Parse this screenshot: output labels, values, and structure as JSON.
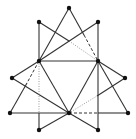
{
  "figure": {
    "width": 136,
    "height": 139,
    "background": "#ffffff",
    "stroke_color": "#333333",
    "light_stroke_color": "#9a9a9a",
    "point_color": "#111111",
    "point_radius": 2.2
  },
  "points": [
    {
      "id": "T",
      "x": 69,
      "y": 8
    },
    {
      "id": "UL",
      "x": 39,
      "y": 22
    },
    {
      "id": "UR",
      "x": 98,
      "y": 22
    },
    {
      "id": "ML",
      "x": 39,
      "y": 61
    },
    {
      "id": "MR",
      "x": 98,
      "y": 61
    },
    {
      "id": "L",
      "x": 12,
      "y": 78
    },
    {
      "id": "R",
      "x": 125,
      "y": 78
    },
    {
      "id": "BL",
      "x": 10,
      "y": 113
    },
    {
      "id": "BC",
      "x": 69,
      "y": 113
    },
    {
      "id": "BR",
      "x": 128,
      "y": 113
    },
    {
      "id": "DL",
      "x": 39,
      "y": 130
    },
    {
      "id": "DR",
      "x": 98,
      "y": 130
    }
  ],
  "segments": [
    {
      "x1": 69,
      "y1": 8,
      "x2": 39,
      "y2": 61,
      "style": "solid"
    },
    {
      "x1": 69,
      "y1": 8,
      "x2": 84,
      "y2": 35,
      "style": "solid"
    },
    {
      "x1": 84,
      "y1": 35,
      "x2": 98,
      "y2": 61,
      "style": "dashed"
    },
    {
      "x1": 39,
      "y1": 22,
      "x2": 39,
      "y2": 61,
      "style": "solid"
    },
    {
      "x1": 39,
      "y1": 22,
      "x2": 69,
      "y2": 41,
      "style": "solid"
    },
    {
      "x1": 69,
      "y1": 41,
      "x2": 98,
      "y2": 61,
      "style": "dotted"
    },
    {
      "x1": 98,
      "y1": 22,
      "x2": 98,
      "y2": 61,
      "style": "solid"
    },
    {
      "x1": 98,
      "y1": 22,
      "x2": 39,
      "y2": 61,
      "style": "solid"
    },
    {
      "x1": 39,
      "y1": 61,
      "x2": 98,
      "y2": 61,
      "style": "solid"
    },
    {
      "x1": 39,
      "y1": 61,
      "x2": 69,
      "y2": 113,
      "style": "solid"
    },
    {
      "x1": 98,
      "y1": 61,
      "x2": 69,
      "y2": 113,
      "style": "solid"
    },
    {
      "x1": 39,
      "y1": 61,
      "x2": 12,
      "y2": 78,
      "style": "solid"
    },
    {
      "x1": 12,
      "y1": 78,
      "x2": 69,
      "y2": 113,
      "style": "solid"
    },
    {
      "x1": 39,
      "y1": 61,
      "x2": 27,
      "y2": 83,
      "style": "dashed"
    },
    {
      "x1": 27,
      "y1": 83,
      "x2": 10,
      "y2": 113,
      "style": "solid"
    },
    {
      "x1": 39,
      "y1": 61,
      "x2": 39,
      "y2": 113,
      "style": "dotted"
    },
    {
      "x1": 39,
      "y1": 113,
      "x2": 39,
      "y2": 130,
      "style": "solid"
    },
    {
      "x1": 98,
      "y1": 61,
      "x2": 125,
      "y2": 78,
      "style": "solid"
    },
    {
      "x1": 98,
      "y1": 61,
      "x2": 128,
      "y2": 113,
      "style": "solid"
    },
    {
      "x1": 98,
      "y1": 61,
      "x2": 98,
      "y2": 130,
      "style": "solid"
    },
    {
      "x1": 69,
      "y1": 113,
      "x2": 97,
      "y2": 96,
      "style": "dotted"
    },
    {
      "x1": 97,
      "y1": 96,
      "x2": 125,
      "y2": 78,
      "style": "solid"
    },
    {
      "x1": 10,
      "y1": 113,
      "x2": 69,
      "y2": 113,
      "style": "solid"
    },
    {
      "x1": 69,
      "y1": 113,
      "x2": 98,
      "y2": 113,
      "style": "dashed"
    },
    {
      "x1": 98,
      "y1": 113,
      "x2": 128,
      "y2": 113,
      "style": "solid"
    },
    {
      "x1": 69,
      "y1": 113,
      "x2": 39,
      "y2": 130,
      "style": "solid"
    },
    {
      "x1": 69,
      "y1": 113,
      "x2": 98,
      "y2": 130,
      "style": "solid"
    }
  ]
}
